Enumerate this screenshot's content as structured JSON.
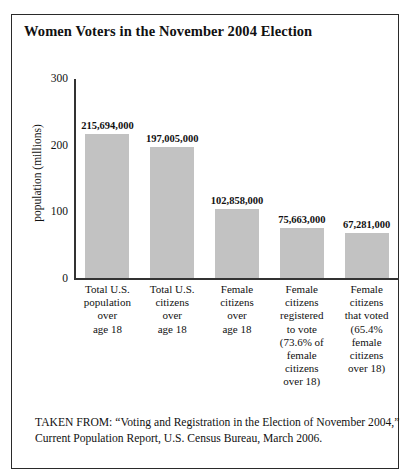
{
  "figure": {
    "title": "Women Voters in the November 2004 Election",
    "source": "TAKEN FROM: “Voting and Registration in the Election of November 2004,” Current Population Report, U.S. Census Bureau, March 2006."
  },
  "chart_data": {
    "type": "bar",
    "title": "Women Voters in the November 2004 Election",
    "xlabel": "",
    "ylabel": "population (millions)",
    "ylim": [
      0,
      300
    ],
    "yticks": [
      0,
      100,
      200,
      300
    ],
    "ytick_labels": [
      "0",
      "100",
      "200",
      "300"
    ],
    "grid": false,
    "legend": false,
    "bar_color": "#c2c2c2",
    "axis_color": "#333333",
    "categories": [
      "Total U.S. population over age 18",
      "Total U.S. citizens over age 18",
      "Female citizens over age 18",
      "Female citizens registered to vote (73.6% of female citizens over 18)",
      "Female citizens that voted (65.4% female citizens over 18)"
    ],
    "category_lines": [
      [
        "Total U.S.",
        "population",
        "over",
        "age 18"
      ],
      [
        "Total U.S.",
        "citizens",
        "over",
        "age 18"
      ],
      [
        "Female",
        "citizens",
        "over",
        "age 18"
      ],
      [
        "Female",
        "citizens",
        "registered",
        "to vote",
        "(73.6% of",
        "female",
        "citizens",
        "over 18)"
      ],
      [
        "Female",
        "citizens",
        "that voted",
        "(65.4%",
        "female",
        "citizens",
        "over 18)"
      ]
    ],
    "values": [
      215.694,
      197.005,
      102.858,
      75.663,
      67.281
    ],
    "data_labels": [
      "215,694,000",
      "197,005,000",
      "102,858,000",
      "75,663,000",
      "67,281,000"
    ]
  }
}
